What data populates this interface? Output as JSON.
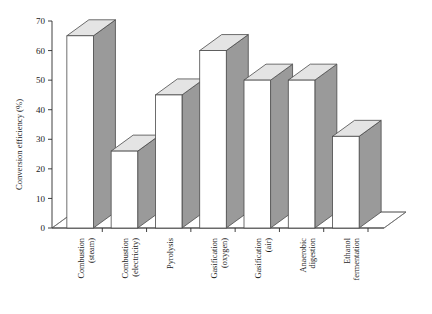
{
  "chart_data": {
    "type": "bar",
    "title": "",
    "subtitle": "",
    "xlabel": "",
    "ylabel": "Conversion efficiency (%)",
    "ylim": [
      0,
      70
    ],
    "ytick_values": [
      0,
      10,
      20,
      30,
      40,
      50,
      60,
      70
    ],
    "ytick_labels": [
      "0",
      "10",
      "20",
      "30",
      "40",
      "50",
      "60",
      "70"
    ],
    "grid": false,
    "legend": null,
    "legend_position": "none",
    "style": "3d-bar",
    "categories": [
      "Combustion\n(steam)",
      "Combustion\n(electricity)",
      "Pyrolysis",
      "Gasification\n(oxygen)",
      "Gasification\n(air)",
      "Anaerobic\ndigestion",
      "Ethanol\nfermentation"
    ],
    "category_lines": [
      [
        "Combustion",
        "(steam)"
      ],
      [
        "Combustion",
        "(electricity)"
      ],
      [
        "Pyrolysis"
      ],
      [
        "Gasification",
        "(oxygen)"
      ],
      [
        "Gasification",
        "(air)"
      ],
      [
        "Anaerobic",
        "digestion"
      ],
      [
        "Ethanol",
        "fermentation"
      ]
    ],
    "values": [
      65,
      26,
      45,
      60,
      50,
      50,
      31
    ],
    "colors": {
      "bar_front": "#ffffff",
      "bar_side": "#9a9a9a",
      "bar_top": "#e4e4e4",
      "bar_edge": "#4a4a4a",
      "axis": "#2b2b2b",
      "floor": "#6f6f6f",
      "background": "#ffffff"
    }
  }
}
